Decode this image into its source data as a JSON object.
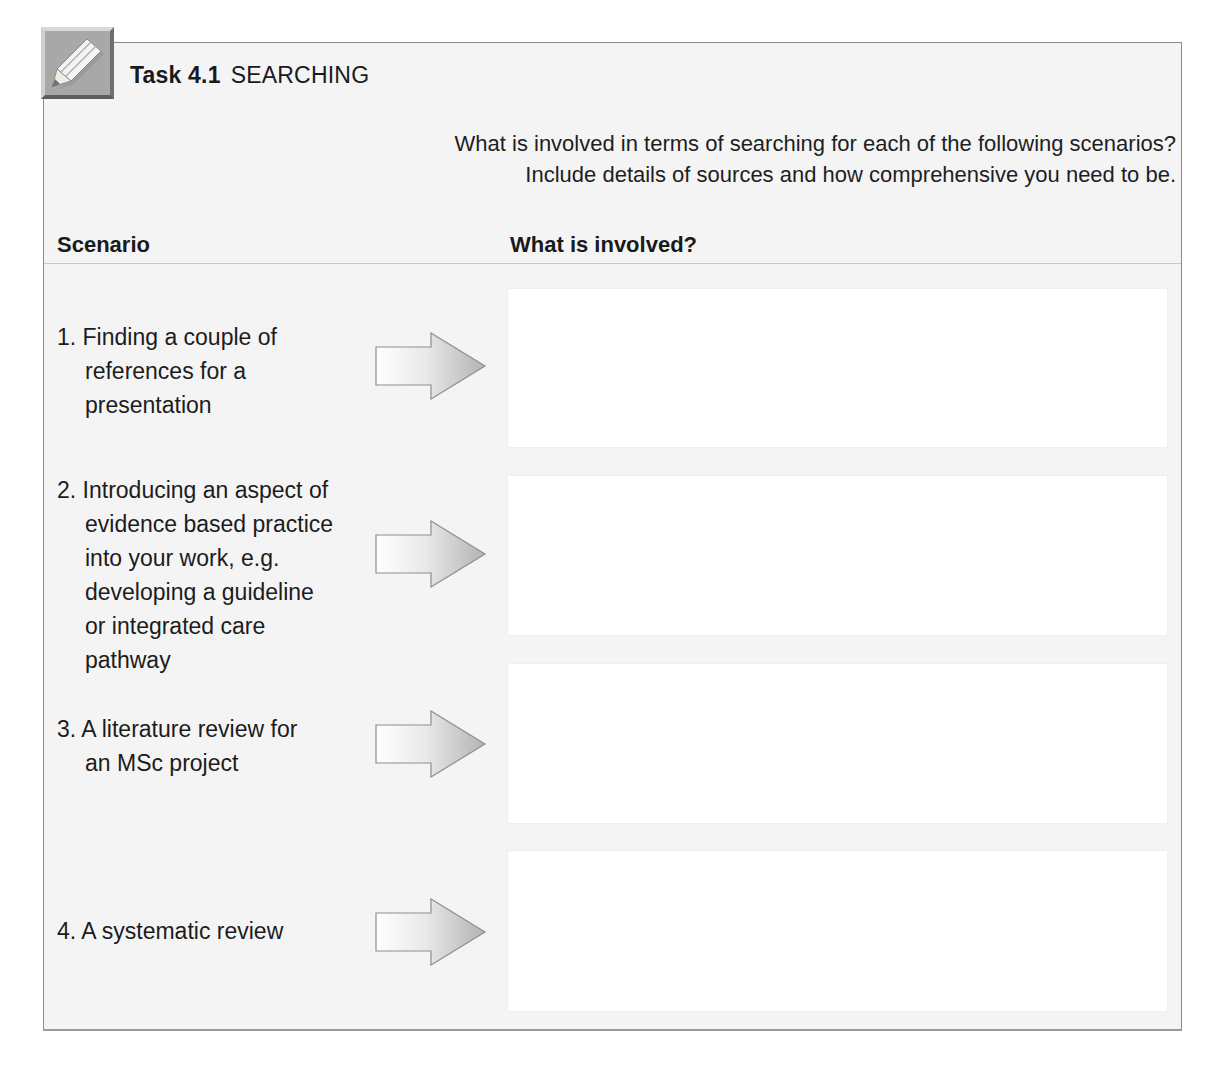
{
  "task": {
    "number_label": "Task 4.1",
    "name": "SEARCHING",
    "icon": "pencil-icon"
  },
  "instructions": {
    "line1": "What is involved in terms of searching for each of the following scenarios?",
    "line2": "Include details of sources and how comprehensive you need to be."
  },
  "table": {
    "headers": {
      "scenario": "Scenario",
      "involved": "What is involved?"
    },
    "rows": [
      {
        "label": "1. Finding a couple of references for a presentation",
        "lines": [
          "1. Finding a couple of",
          "references for a",
          "presentation"
        ],
        "answer": ""
      },
      {
        "label": "2. Introducing an aspect of evidence based practice into your work, e.g. developing a guideline or integrated care pathway",
        "lines": [
          "2. Introducing an aspect of",
          "evidence based practice",
          "into your work, e.g.",
          "developing a guideline",
          "or integrated care",
          "pathway"
        ],
        "answer": ""
      },
      {
        "label": "3. A literature review for an MSc project",
        "lines": [
          "3. A literature review for",
          "an MSc project"
        ],
        "answer": ""
      },
      {
        "label": "4. A systematic review",
        "lines": [
          "4. A systematic review"
        ],
        "answer": ""
      }
    ]
  },
  "colors": {
    "panel_bg": "#f4f4f4",
    "frame_border": "#8a8a8a",
    "icon_bg": "#a8a8a8",
    "arrow_gradient_start": "#ffffff",
    "arrow_gradient_end": "#b5b5b5"
  }
}
